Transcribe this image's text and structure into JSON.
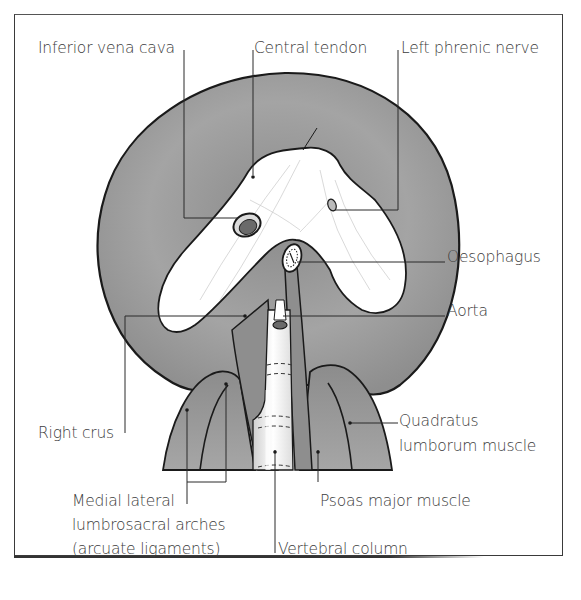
{
  "diagram": {
    "colors": {
      "muscle_fill": "#9a9a9a",
      "tendon_fill": "#ffffff",
      "outline": "#1a1a1a",
      "leader_line": "#2a2a2a",
      "label_text": "#3c3c3c",
      "frame": "#3a3a3a"
    },
    "labels": {
      "inferior_vena_cava": "Inferior vena cava",
      "central_tendon": "Central tendon",
      "left_phrenic_nerve": "Left phrenic nerve",
      "oesophagus": "Oesophagus",
      "aorta": "Aorta",
      "right_crus": "Right crus",
      "quadratus_line1": "Quadratus",
      "quadratus_line2": "lumborum muscle",
      "medial_lateral_line1": "Medial lateral",
      "medial_lateral_line2": "lumbrosacral arches",
      "medial_lateral_line3": "(arcuate ligaments)",
      "psoas_major": "Psoas major muscle",
      "vertebral_column": "Vertebral column"
    }
  }
}
